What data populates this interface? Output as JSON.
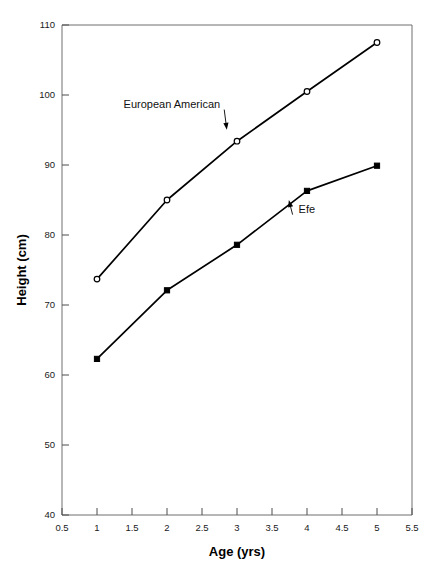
{
  "chart_data": {
    "type": "line",
    "title": "",
    "xlabel": "Age (yrs)",
    "ylabel": "Height (cm)",
    "xlim": [
      0.5,
      5.5
    ],
    "ylim": [
      40,
      110
    ],
    "x": [
      1,
      2,
      3,
      4,
      5
    ],
    "xticks": [
      "0.5",
      "1",
      "1.5",
      "2",
      "2.5",
      "3",
      "3.5",
      "4",
      "4.5",
      "5",
      "5.5"
    ],
    "xtick_values": [
      0.5,
      1,
      1.5,
      2,
      2.5,
      3,
      3.5,
      4,
      4.5,
      5,
      5.5
    ],
    "yticks": [
      "40",
      "50",
      "60",
      "70",
      "80",
      "90",
      "100",
      "110"
    ],
    "ytick_values": [
      40,
      50,
      60,
      70,
      80,
      90,
      100,
      110
    ],
    "grid": false,
    "legend_position": "inline-annotation",
    "series": [
      {
        "name": "European American",
        "marker": "open-circle",
        "color": "#000000",
        "values": [
          73.7,
          85.0,
          93.4,
          100.5,
          107.5
        ]
      },
      {
        "name": "Efe",
        "marker": "filled-square",
        "color": "#000000",
        "values": [
          62.3,
          72.1,
          78.6,
          86.3,
          89.9
        ]
      }
    ],
    "annotations": [
      {
        "text": "European American",
        "text_x": 1.38,
        "text_y": 98.2,
        "point_x": 2.86,
        "point_y": 94.6
      },
      {
        "text": "Efe",
        "text_x": 3.88,
        "text_y": 83.2,
        "point_x": 3.73,
        "point_y": 85.4
      }
    ]
  },
  "caption": {
    "text": ""
  }
}
